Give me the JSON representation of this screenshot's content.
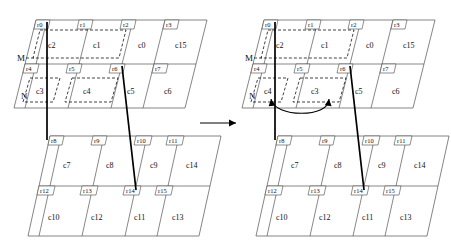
{
  "figure": {
    "type": "mesh-partition-diagram",
    "transition_arrow": "→",
    "swap_arrow_label": "swap"
  },
  "panels": {
    "left": {
      "upper": {
        "regions": [
          "r0",
          "r1",
          "r2",
          "r3",
          "r4",
          "r5",
          "r6",
          "r7"
        ],
        "cells_top": [
          "c2",
          "c1",
          "c0",
          "c15"
        ],
        "cells_bottom": [
          "c3",
          "c4",
          "c5",
          "c6"
        ],
        "markers": [
          "M",
          "N"
        ]
      },
      "lower": {
        "regions": [
          "r8",
          "r9",
          "r10",
          "r11",
          "r12",
          "r13",
          "r14",
          "r15"
        ],
        "cells_top": [
          "c7",
          "c8",
          "c9",
          "c14"
        ],
        "cells_bottom": [
          "c10",
          "c12",
          "c11",
          "c13"
        ]
      }
    },
    "right": {
      "upper": {
        "regions": [
          "r0",
          "r1",
          "r2",
          "r3",
          "r4",
          "r5",
          "r6",
          "r7"
        ],
        "cells_top": [
          "c2",
          "c1",
          "c0",
          "c15"
        ],
        "cells_bottom": [
          "c4",
          "c3",
          "c5",
          "c6"
        ],
        "markers": [
          "M",
          "N"
        ]
      },
      "lower": {
        "regions": [
          "r8",
          "r9",
          "r10",
          "r11",
          "r12",
          "r13",
          "r14",
          "r15"
        ],
        "cells_top": [
          "c7",
          "c8",
          "c9",
          "c14"
        ],
        "cells_bottom": [
          "c10",
          "c12",
          "c11",
          "c13"
        ]
      }
    }
  },
  "labels": {
    "l_u_r0": "r0",
    "l_u_r1": "r1",
    "l_u_r2": "r2",
    "l_u_r3": "r3",
    "l_u_r4": "r4",
    "l_u_r5": "r5",
    "l_u_r6": "r6",
    "l_u_r7": "r7",
    "l_u_c2": "c2",
    "l_u_c1": "c1",
    "l_u_c0": "c0",
    "l_u_c15": "c15",
    "l_u_c3": "c3",
    "l_u_c4": "c4",
    "l_u_c5": "c5",
    "l_u_c6": "c6",
    "l_u_M": "M",
    "l_u_N": "N",
    "l_l_r8": "r8",
    "l_l_r9": "r9",
    "l_l_r10": "r10",
    "l_l_r11": "r11",
    "l_l_r12": "r12",
    "l_l_r13": "r13",
    "l_l_r14": "r14",
    "l_l_r15": "r15",
    "l_l_c7": "c7",
    "l_l_c8": "c8",
    "l_l_c9": "c9",
    "l_l_c14": "c14",
    "l_l_c10": "c10",
    "l_l_c12": "c12",
    "l_l_c11": "c11",
    "l_l_c13": "c13",
    "r_u_r0": "r0",
    "r_u_r1": "r1",
    "r_u_r2": "r2",
    "r_u_r3": "r3",
    "r_u_r4": "r4",
    "r_u_r5": "r5",
    "r_u_r6": "r6",
    "r_u_r7": "r7",
    "r_u_c2": "c2",
    "r_u_c1": "c1",
    "r_u_c0": "c0",
    "r_u_c15": "c15",
    "r_u_c4": "c4",
    "r_u_c3": "c3",
    "r_u_c5": "c5",
    "r_u_c6": "c6",
    "r_u_M": "M",
    "r_u_N": "N",
    "r_l_r8": "r8",
    "r_l_r9": "r9",
    "r_l_r10": "r10",
    "r_l_r11": "r11",
    "r_l_r12": "r12",
    "r_l_r13": "r13",
    "r_l_r14": "r14",
    "r_l_r15": "r15",
    "r_l_c7": "c7",
    "r_l_c8": "c8",
    "r_l_c9": "c9",
    "r_l_c14": "c14",
    "r_l_c10": "c10",
    "r_l_c12": "c12",
    "r_l_c11": "c11",
    "r_l_c13": "c13"
  },
  "colors": {
    "stroke": "#555555",
    "thick_stroke": "#000000",
    "dashed_stroke": "#111111",
    "background": "#ffffff"
  }
}
